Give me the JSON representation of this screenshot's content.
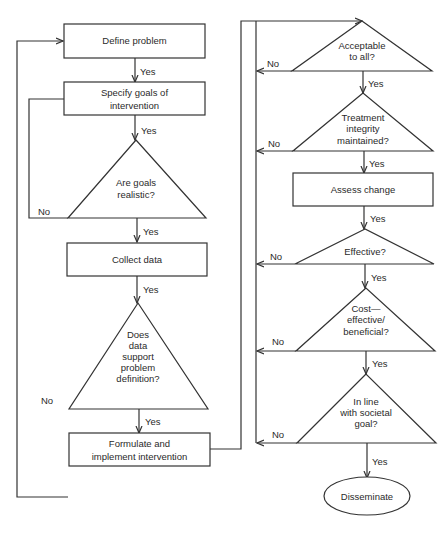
{
  "diagram": {
    "type": "flowchart",
    "left_column": {
      "define_problem": "Define problem",
      "specify_goals": [
        "Specify goals of",
        "intervention"
      ],
      "goals_realistic": [
        "Are goals",
        "realistic?"
      ],
      "collect_data": "Collect data",
      "data_support": [
        "Does",
        "data",
        "support",
        "problem",
        "definition?"
      ],
      "formulate": [
        "Formulate and",
        "implement  intervention"
      ]
    },
    "right_column": {
      "acceptable": [
        "Acceptable",
        "to all?"
      ],
      "integrity": [
        "Treatment",
        "integrity",
        "maintained?"
      ],
      "assess_change": "Assess change",
      "effective": "Effective?",
      "cost_effective": [
        "Cost—",
        "effective/",
        "beneficial?"
      ],
      "societal_goal": [
        "In line",
        "with societal",
        "goal?"
      ],
      "disseminate": "Disseminate"
    },
    "labels": {
      "yes": "Yes",
      "no": "No"
    }
  }
}
